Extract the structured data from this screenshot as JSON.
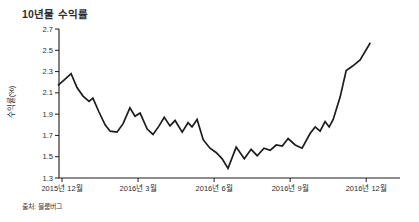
{
  "page": {
    "background": "#ffffff"
  },
  "chart_data": {
    "type": "line",
    "title": "10년물 수익률",
    "ylabel": "수익률(%)",
    "source": "출처: 블룸버그",
    "legend": "none",
    "grid": false,
    "ylim": [
      1.3,
      2.7
    ],
    "y_ticks": [
      1.3,
      1.5,
      1.7,
      1.9,
      2.1,
      2.3,
      2.5,
      2.7
    ],
    "x_ticks": [
      {
        "m": 0,
        "label": "2015년 12월"
      },
      {
        "m": 3,
        "label": "2016년 3월"
      },
      {
        "m": 6,
        "label": "2016년 6월"
      },
      {
        "m": 9,
        "label": "2016년 9월"
      },
      {
        "m": 12,
        "label": "2016년 12월"
      }
    ],
    "xlim_months": [
      -0.2,
      13.35
    ],
    "colors": {
      "line": "#1c1c1c",
      "axis": "#1c1c1c",
      "text": "#2e2e2e"
    },
    "points": [
      [
        -0.16,
        2.17
      ],
      [
        0.08,
        2.22
      ],
      [
        0.36,
        2.28
      ],
      [
        0.59,
        2.15
      ],
      [
        0.83,
        2.07
      ],
      [
        1.07,
        2.02
      ],
      [
        1.22,
        2.05
      ],
      [
        1.46,
        1.92
      ],
      [
        1.7,
        1.8
      ],
      [
        1.9,
        1.74
      ],
      [
        2.17,
        1.73
      ],
      [
        2.41,
        1.81
      ],
      [
        2.68,
        1.96
      ],
      [
        2.88,
        1.88
      ],
      [
        3.08,
        1.91
      ],
      [
        3.36,
        1.76
      ],
      [
        3.59,
        1.71
      ],
      [
        3.83,
        1.79
      ],
      [
        4.03,
        1.87
      ],
      [
        4.26,
        1.79
      ],
      [
        4.46,
        1.84
      ],
      [
        4.74,
        1.73
      ],
      [
        4.97,
        1.82
      ],
      [
        5.13,
        1.78
      ],
      [
        5.33,
        1.85
      ],
      [
        5.57,
        1.66
      ],
      [
        5.84,
        1.58
      ],
      [
        6.08,
        1.54
      ],
      [
        6.32,
        1.48
      ],
      [
        6.55,
        1.39
      ],
      [
        6.87,
        1.59
      ],
      [
        7.19,
        1.48
      ],
      [
        7.46,
        1.57
      ],
      [
        7.7,
        1.51
      ],
      [
        7.97,
        1.58
      ],
      [
        8.21,
        1.56
      ],
      [
        8.45,
        1.61
      ],
      [
        8.69,
        1.6
      ],
      [
        8.92,
        1.67
      ],
      [
        9.2,
        1.61
      ],
      [
        9.47,
        1.58
      ],
      [
        9.79,
        1.72
      ],
      [
        9.99,
        1.78
      ],
      [
        10.18,
        1.74
      ],
      [
        10.38,
        1.83
      ],
      [
        10.54,
        1.78
      ],
      [
        10.7,
        1.85
      ],
      [
        10.97,
        2.06
      ],
      [
        11.21,
        2.31
      ],
      [
        11.45,
        2.35
      ],
      [
        11.76,
        2.41
      ],
      [
        12.16,
        2.57
      ]
    ]
  }
}
